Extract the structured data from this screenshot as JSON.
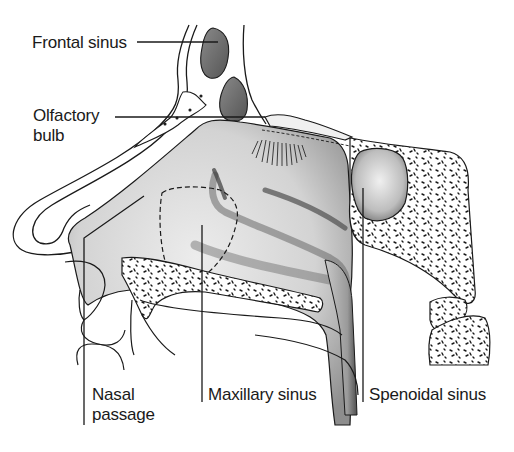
{
  "diagram": {
    "colors": {
      "background": "#ffffff",
      "line": "#1a1a1a",
      "shade_dark": "#6e6e6e",
      "shade_mid": "#b5b5b5",
      "shade_light": "#e2e2e2",
      "bone_fill": "#ffffff"
    },
    "labels": {
      "frontal_sinus": "Frontal sinus",
      "olfactory_bulb_line1": "Olfactory",
      "olfactory_bulb_line2": "bulb",
      "nasal_passage_line1": "Nasal",
      "nasal_passage_line2": "passage",
      "maxillary_sinus": "Maxillary sinus",
      "sphenoidal_sinus": "Spenoidal sinus"
    },
    "structures": [
      "frontal-sinus",
      "olfactory-bulb",
      "olfactory-nerve-fibres",
      "nasal-bone",
      "nasal-cavity",
      "nasal-conchae",
      "maxillary-sinus-outline",
      "hard-palate",
      "sphenoidal-sinus",
      "sphenoid-bone",
      "cervical-vertebrae",
      "upper-lip",
      "nostril"
    ]
  }
}
